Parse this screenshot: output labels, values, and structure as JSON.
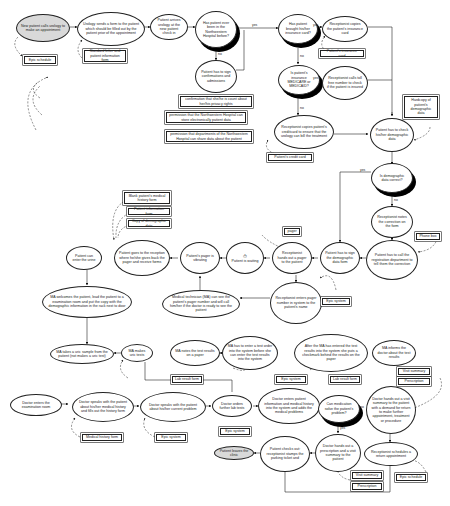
{
  "diagram": {
    "nodes": {
      "n_call": "New patient calls urology to make an appointment",
      "n_form": "Urology sends a form to the patient which should be filled out by the patient prior of the appointment",
      "n_arrive": "Patient arrives urology at the new patient check in",
      "n_been": "Has patient ever been in the Northwestern Hospital before?",
      "n_ins": "Has patient brought his/her insurance card?",
      "n_copy": "Receptionist copies the patient's insurance card",
      "n_sign": "Patient has to sign confirmations and admissions",
      "n_medicare": "Is patient's insurance MEDICARE or MEDICAID?",
      "n_tollfree": "Receptionist calls toll free number to check if the patient is insured",
      "n_credit": "Receptionist copies patient's creditcard to ensure that the urology can bill the treatment",
      "n_check": "Patient has to check his/her demographic data",
      "n_correct": "Is demographic data correct?",
      "n_notes": "Receptionist notes the correction on the form",
      "n_call_reg": "Patient has to call the registration department to tell them the correction",
      "n_sign_demo": "Patient has to sign the demographic data form",
      "n_pager": "Receptionist hands out a pager to the patient",
      "n_waiting": "Patient is waiting",
      "n_pager_vib": "Patient's pager is vibrating",
      "n_goes": "Patient goes to the reception where he/she gives back the pager and receive forms",
      "n_urine": "Patient can enter the urine",
      "n_enters_pager": "Receptionist enters pager number in system to the patient's name",
      "n_tech": "Medical technician (MA) can see the patient's pager number and will call him/her if the doctor is ready to see the patient",
      "n_welcome": "MA welcomes the patient, lead the patient to a examination room and put the copy with the demographic information in the rack next to door",
      "n_sample": "MA takes a uric sample from the patient (not makes a uric test)",
      "n_tests": "MA makes uric tests",
      "n_notes_paper": "MA notes the test results on a paper",
      "n_enter_order": "MA has to enter a test order into the system before she can enter the test results into the system",
      "n_after": "After the MA has entered the test results into the system she puts a checkmark behind the results on the paper",
      "n_informs": "MA informs the doctor about the test results",
      "n_doc_exam": "Doctor enters the examination room",
      "n_doc_history": "Doctor speaks with the patient about his/her medical history and fills out the history form",
      "n_doc_problem": "Doctor speaks with the patient about his/her current problem",
      "n_lab": "Doctor orders further lab tests",
      "n_doc_enters": "Doctor enters patient information and medical history into the system and adds the medical problems",
      "n_medication": "Can medication solve the patient's problem?",
      "n_visit": "Doctor hands out a visit summary to the patient with a demand for return to make further appointment, treatment or procedure",
      "n_return": "Receptionist schedules a return appointment",
      "n_prescription": "Doctor hands out a prescription and a visit summary to the patient",
      "n_checks_out": "Patient checks out: receptionist stamps the parking ticket and",
      "n_leaves": "Patient leaves the clinic"
    },
    "docs": {
      "d_epic_sched1": "Epic schedule",
      "d_std_letter": "Standard letter and patient information form",
      "d_ins_card": "Patient's insurance card",
      "d_confirm": "confirmation that she/he is count about her/his privacy rights",
      "d_perm_nw": "permission that the Northwestern Hospital can store electronically patient data",
      "d_perm_dept": "permission that departments of the Northwestern Hospital can share data about the patient",
      "d_cc": "Patient's credit card",
      "d_hardcopy": "Hardcopy of patient's demographic data",
      "d_phone": "Phone box",
      "d_blank": "Blank patient's medical history form",
      "d_info_form": "Patient information form",
      "d_copy_demo": "Copy of demographic data",
      "d_pager": "pager",
      "d_epic1": "Epic system",
      "d_lab1": "Lab result form",
      "d_epic2": "Epic system",
      "d_lab2": "Lab result form",
      "d_visit_sum1": "Visit summary",
      "d_prescr1": "Prescription",
      "d_med_hist": "Medical history form",
      "d_epic3": "Epic system",
      "d_epic4": "Epic system",
      "d_visit_sum2": "Visit summary",
      "d_prescr2": "Prescription",
      "d_epic_sched2": "Epic schedule"
    },
    "edge_labels": {
      "yes": "yes",
      "no": "no"
    },
    "icons": {
      "clock": "⏱"
    }
  }
}
